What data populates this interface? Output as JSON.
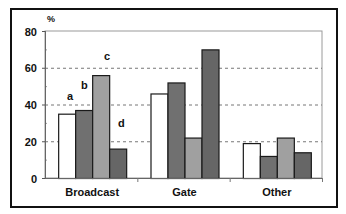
{
  "chart_data": {
    "type": "bar",
    "title": "",
    "xlabel": "",
    "ylabel": "%",
    "ylim": [
      0,
      80
    ],
    "yticks": [
      0,
      20,
      40,
      60,
      80
    ],
    "grid": "dashed horizontal at 20, 40, 60",
    "legend": "inline letters a, b, c, d above Broadcast bars",
    "categories": [
      "Broadcast",
      "Gate",
      "Other"
    ],
    "series": [
      {
        "name": "a",
        "color": "#ffffff",
        "values": [
          35,
          46,
          19
        ]
      },
      {
        "name": "b",
        "color": "#707070",
        "values": [
          37,
          52,
          12
        ]
      },
      {
        "name": "c",
        "color": "#a0a0a0",
        "values": [
          56,
          22,
          22
        ]
      },
      {
        "name": "d",
        "color": "#666666",
        "values": [
          16,
          70,
          14
        ]
      }
    ]
  },
  "axis": {
    "unit": "%",
    "ticks": [
      "0",
      "20",
      "40",
      "60",
      "80"
    ]
  },
  "labels": {
    "a": "a",
    "b": "b",
    "c": "c",
    "d": "d"
  }
}
